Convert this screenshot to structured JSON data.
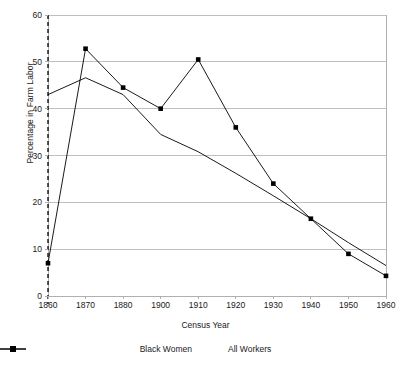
{
  "chart_data": {
    "type": "line",
    "title": "",
    "xlabel": "Census Year",
    "ylabel": "Percentage in Farm Labor",
    "categories": [
      "1860",
      "1870",
      "1880",
      "1900",
      "1910",
      "1920",
      "1930",
      "1940",
      "1950",
      "1960"
    ],
    "yticks": [
      "0",
      "10",
      "20",
      "30",
      "40",
      "50",
      "60"
    ],
    "ylim": [
      0,
      60
    ],
    "grid": true,
    "legend_position": "bottom",
    "annotations": [
      {
        "name": "emancipation-reference-line",
        "type": "vertical-dashed-line",
        "at_category": "1860"
      }
    ],
    "series": [
      {
        "name": "Black Women",
        "marker": "square",
        "values": [
          7,
          52.8,
          44.5,
          40,
          50.5,
          36,
          24,
          16.5,
          9,
          4.3
        ]
      },
      {
        "name": "All Workers",
        "marker": "none",
        "values": [
          43,
          46.6,
          43,
          34.5,
          30.8,
          26.2,
          21.4,
          16.5,
          11.4,
          6.5
        ]
      }
    ],
    "colors": {
      "line": "#000000",
      "grid": "#bfbfbf",
      "border": "#b0b0b0",
      "text": "#1a1a1a"
    }
  },
  "legend": {
    "items": [
      {
        "label": "Black Women"
      },
      {
        "label": "All Workers"
      }
    ]
  }
}
